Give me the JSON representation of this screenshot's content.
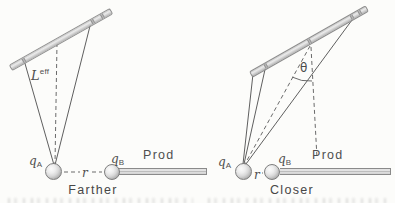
{
  "figure": {
    "left": {
      "label_L": {
        "base": "L",
        "script": "eff"
      },
      "label_qA": {
        "base": "q",
        "sub": "A"
      },
      "label_qB": {
        "base": "q",
        "sub": "B"
      },
      "label_r": "r",
      "label_rod": "Prod",
      "caption": "Farther"
    },
    "right": {
      "label_theta": "θ",
      "label_qA": {
        "base": "q",
        "sub": "A"
      },
      "label_qB": {
        "base": "q",
        "sub": "B"
      },
      "label_r": "r",
      "label_rod": "Prod",
      "caption": "Closer"
    },
    "colors": {
      "background": "#fcfcfa",
      "line": "#5f5f5f",
      "bar_fill": "#d6d6d6",
      "bar_edge": "#8c8c8c",
      "text": "#4f4f4f"
    }
  }
}
